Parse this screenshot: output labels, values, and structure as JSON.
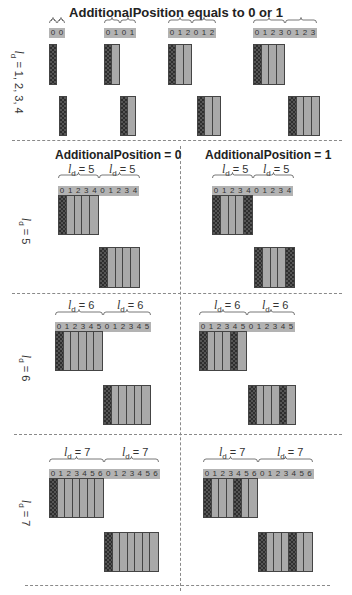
{
  "title": "AdditionalPosition equals to 0 or 1",
  "subtitles": {
    "ap0": "AdditionalPosition = 0",
    "ap1": "AdditionalPosition = 1"
  },
  "row_labels": {
    "r1": {
      "var": "l",
      "sub": "d",
      "rest": " = 1, 2, 3, 4"
    },
    "r5": {
      "var": "l",
      "sub": "d",
      "rest": " = 5"
    },
    "r6": {
      "var": "l",
      "sub": "d",
      "rest": " = 6"
    },
    "r7": {
      "var": "l",
      "sub": "d",
      "rest": " = 7"
    }
  },
  "ld_labels": {
    "ld5": {
      "var": "l",
      "sub": "d",
      "rest": " = 5"
    },
    "ld6": {
      "var": "l",
      "sub": "d",
      "rest": " = 6"
    },
    "ld7": {
      "var": "l",
      "sub": "d",
      "rest": " = 7"
    }
  },
  "colors": {
    "slot_bar": "#b3b3b3",
    "data_symbol": "#a9a9a9",
    "dmrs_symbol_pattern": "#2e2e2e",
    "dashed_divider": "#8a8a8a"
  },
  "legend_semantics": {
    "hatched": "DMRS symbol",
    "plain_gray": "data symbol"
  },
  "panels": [
    {
      "id": "top-ld1",
      "ld": 1,
      "indices": [
        "0",
        "0"
      ],
      "x": 49,
      "upper": {
        "x": 49,
        "pattern": [
          "dm"
        ]
      },
      "lower": {
        "x": 59,
        "pattern": [
          "dm"
        ]
      }
    },
    {
      "id": "top-ld2",
      "ld": 2,
      "indices": [
        "0",
        "1",
        "0",
        "1"
      ],
      "x": 104,
      "upper": {
        "x": 104,
        "pattern": [
          "dm",
          "d"
        ]
      },
      "lower": {
        "x": 120,
        "pattern": [
          "dm",
          "d"
        ]
      }
    },
    {
      "id": "top-ld3",
      "ld": 3,
      "indices": [
        "0",
        "1",
        "2",
        "0",
        "1",
        "2"
      ],
      "x": 168,
      "upper": {
        "x": 168,
        "pattern": [
          "dm",
          "d",
          "d"
        ]
      },
      "lower": {
        "x": 197,
        "pattern": [
          "dm",
          "d",
          "d"
        ]
      }
    },
    {
      "id": "top-ld4",
      "ld": 4,
      "indices": [
        "0",
        "1",
        "2",
        "3",
        "0",
        "1",
        "2",
        "3"
      ],
      "x": 253,
      "upper": {
        "x": 253,
        "pattern": [
          "dm",
          "d",
          "d",
          "d"
        ]
      },
      "lower": {
        "x": 288,
        "pattern": [
          "dm",
          "d",
          "d",
          "d"
        ]
      }
    },
    {
      "id": "ap0-ld5",
      "ld": 5,
      "indices": [
        "0",
        "1",
        "2",
        "3",
        "4",
        "0",
        "1",
        "2",
        "3",
        "4"
      ],
      "x": 58,
      "upper": {
        "x": 58,
        "pattern": [
          "dm",
          "d",
          "d",
          "d",
          "d"
        ]
      },
      "lower": {
        "x": 99,
        "pattern": [
          "dm",
          "d",
          "d",
          "d",
          "d"
        ]
      }
    },
    {
      "id": "ap1-ld5",
      "ld": 5,
      "indices": [
        "0",
        "1",
        "2",
        "3",
        "4",
        "0",
        "1",
        "2",
        "3",
        "4"
      ],
      "x": 212,
      "upper": {
        "x": 212,
        "pattern": [
          "dm",
          "d",
          "d",
          "d",
          "dm"
        ]
      },
      "lower": {
        "x": 254,
        "pattern": [
          "dm",
          "d",
          "d",
          "d",
          "dm"
        ]
      }
    },
    {
      "id": "ap0-ld6",
      "ld": 6,
      "indices": [
        "0",
        "1",
        "2",
        "3",
        "4",
        "5",
        "0",
        "1",
        "2",
        "3",
        "4",
        "5"
      ],
      "x": 55,
      "upper": {
        "x": 55,
        "pattern": [
          "dm",
          "d",
          "d",
          "d",
          "d",
          "d"
        ]
      },
      "lower": {
        "x": 103,
        "pattern": [
          "dm",
          "d",
          "d",
          "d",
          "d",
          "d"
        ]
      }
    },
    {
      "id": "ap1-ld6",
      "ld": 6,
      "indices": [
        "0",
        "1",
        "2",
        "3",
        "4",
        "5",
        "0",
        "1",
        "2",
        "3",
        "4",
        "5"
      ],
      "x": 199,
      "upper": {
        "x": 199,
        "pattern": [
          "dm",
          "d",
          "d",
          "d",
          "dm",
          "d"
        ]
      },
      "lower": {
        "x": 248,
        "pattern": [
          "dm",
          "d",
          "d",
          "d",
          "dm",
          "d"
        ]
      }
    },
    {
      "id": "ap0-ld7",
      "ld": 7,
      "indices": [
        "0",
        "1",
        "2",
        "3",
        "4",
        "5",
        "6",
        "0",
        "1",
        "2",
        "3",
        "4",
        "5",
        "6"
      ],
      "x": 49,
      "upper": {
        "x": 49,
        "pattern": [
          "dm",
          "d",
          "d",
          "d",
          "d",
          "d",
          "d"
        ]
      },
      "lower": {
        "x": 104,
        "pattern": [
          "dm",
          "d",
          "d",
          "d",
          "d",
          "d",
          "d"
        ]
      }
    },
    {
      "id": "ap1-ld7",
      "ld": 7,
      "indices": [
        "0",
        "1",
        "2",
        "3",
        "4",
        "5",
        "6",
        "0",
        "1",
        "2",
        "3",
        "4",
        "5",
        "6"
      ],
      "x": 203,
      "upper": {
        "x": 203,
        "pattern": [
          "dm",
          "d",
          "d",
          "d",
          "dm",
          "d",
          "d"
        ]
      },
      "lower": {
        "x": 258,
        "pattern": [
          "dm",
          "d",
          "d",
          "d",
          "dm",
          "d",
          "d"
        ]
      }
    }
  ]
}
